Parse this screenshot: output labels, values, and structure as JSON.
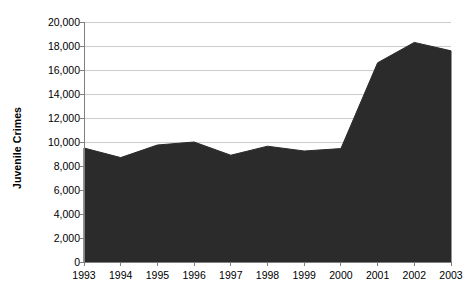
{
  "chart_data": {
    "type": "area",
    "title": "",
    "subtitle": "",
    "xlabel": "",
    "ylabel": "Juvenile Crimes",
    "categories": [
      "1993",
      "1994",
      "1995",
      "1996",
      "1997",
      "1998",
      "1999",
      "2000",
      "2001",
      "2002",
      "2003"
    ],
    "x": [
      1993,
      1994,
      1995,
      1996,
      1997,
      1998,
      1999,
      2000,
      2001,
      2002,
      2003
    ],
    "values": [
      9500,
      8700,
      9750,
      10000,
      8900,
      9650,
      9250,
      9450,
      16600,
      18300,
      17600
    ],
    "series": [
      {
        "name": "Juvenile Crimes",
        "values": [
          9500,
          8700,
          9750,
          10000,
          8900,
          9650,
          9250,
          9450,
          16600,
          18300,
          17600
        ]
      }
    ],
    "ylim": [
      0,
      20000
    ],
    "y_ticks": [
      0,
      2000,
      4000,
      6000,
      8000,
      10000,
      12000,
      14000,
      16000,
      18000,
      20000
    ],
    "y_tick_labels": [
      "0",
      "2,000",
      "4,000",
      "6,000",
      "8,000",
      "10,000",
      "12,000",
      "14,000",
      "16,000",
      "18,000",
      "20,000"
    ],
    "xlim": [
      1993,
      2003
    ],
    "grid": true,
    "grid_axis": "y",
    "legend": false,
    "legend_position": "none",
    "annotations": []
  },
  "style": {
    "area_fill_color": "#2b2b2b",
    "grid_line_color": "#cccccc",
    "axis_line_color": "#808080",
    "tick_mark_color": "#808080",
    "background_color": "#ffffff",
    "text_color": "#000000"
  },
  "axis_titles": {
    "y": "Juvenile Crimes"
  }
}
